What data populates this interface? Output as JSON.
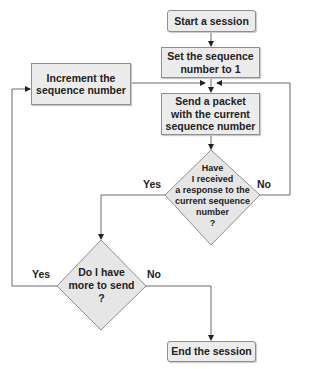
{
  "flowchart": {
    "nodes": {
      "start": {
        "label": "Start a session"
      },
      "set": {
        "label": "Set the sequence\nnumber to 1"
      },
      "increment": {
        "label": "Increment the\nsequence number"
      },
      "send": {
        "label": "Send a packet\nwith the current\nsequence number"
      },
      "received": {
        "label": "Have\nI received\na response to the\ncurrent sequence\nnumber\n?"
      },
      "more": {
        "label": "Do I have\nmore to send\n?"
      },
      "end": {
        "label": "End the session"
      }
    },
    "edge_labels": {
      "received_yes": "Yes",
      "received_no": "No",
      "more_yes": "Yes",
      "more_no": "No"
    },
    "colors": {
      "fill": "#ececec",
      "stroke": "#8f8f8f",
      "line": "#6b6b6b"
    }
  }
}
